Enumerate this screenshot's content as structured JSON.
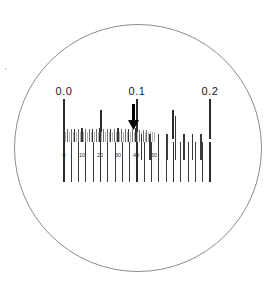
{
  "view": {
    "title": "Optical scale reticle view",
    "background_color": "#ffffff",
    "width": 277,
    "height": 284
  },
  "lens": {
    "name": "circular-field-of-view",
    "center_x": 138,
    "center_y": 148,
    "radius": 124,
    "stroke_color": "#8d8d8d"
  },
  "speck": {
    "x": 5,
    "y": 68,
    "color": "#cfcfcf"
  },
  "chart_data": {
    "type": "scale",
    "xlabel": "",
    "ylabel": "",
    "main_scale": {
      "labels": [
        "0.0",
        "0.1",
        "0.2"
      ],
      "label_values": [
        0.0,
        0.1,
        0.2
      ],
      "label_x": [
        64,
        137,
        210
      ],
      "unit_span_px": 73,
      "division_count": 20,
      "division_step": 0.01,
      "x_start": 64,
      "x_end": 210,
      "tick_color": "#3a3a3a"
    },
    "upper_ticks": [
      {
        "x": 64,
        "y": 99,
        "h": 40,
        "w": 1.6,
        "class": "major"
      },
      {
        "x": 101,
        "y": 110,
        "h": 29,
        "w": 1.4,
        "class": "major"
      },
      {
        "x": 137,
        "y": 99,
        "h": 40,
        "w": 1.6,
        "class": "major"
      },
      {
        "x": 173,
        "y": 110,
        "h": 29,
        "w": 1.4,
        "class": "major"
      },
      {
        "x": 210,
        "y": 99,
        "h": 40,
        "w": 1.6,
        "class": "major"
      }
    ],
    "mid_band": {
      "y": 128,
      "height": 14,
      "x_start": 64,
      "x_end": 155,
      "description": "dense vernier micro-division band"
    },
    "micro_ticks": [
      {
        "x": 64.0,
        "h": 14,
        "w": 1.3,
        "class": "micro-dark"
      },
      {
        "x": 65.8,
        "h": 10,
        "w": 0.8,
        "class": "micro-light"
      },
      {
        "x": 67.6,
        "h": 13,
        "w": 0.9,
        "class": "micro"
      },
      {
        "x": 69.4,
        "h": 10,
        "w": 0.8,
        "class": "micro-light"
      },
      {
        "x": 71.2,
        "h": 13,
        "w": 1.0,
        "class": "micro"
      },
      {
        "x": 73.0,
        "h": 10,
        "w": 0.8,
        "class": "micro-light"
      },
      {
        "x": 74.8,
        "h": 13,
        "w": 1.1,
        "class": "micro-dark"
      },
      {
        "x": 76.6,
        "h": 10,
        "w": 0.8,
        "class": "micro-light"
      },
      {
        "x": 78.4,
        "h": 13,
        "w": 0.9,
        "class": "micro"
      },
      {
        "x": 80.2,
        "h": 10,
        "w": 0.8,
        "class": "micro-light"
      },
      {
        "x": 82.0,
        "h": 14,
        "w": 1.3,
        "class": "micro-dark"
      },
      {
        "x": 83.8,
        "h": 10,
        "w": 0.8,
        "class": "micro-light"
      },
      {
        "x": 85.6,
        "h": 13,
        "w": 0.9,
        "class": "micro"
      },
      {
        "x": 87.4,
        "h": 10,
        "w": 0.8,
        "class": "micro-light"
      },
      {
        "x": 89.2,
        "h": 13,
        "w": 1.0,
        "class": "micro"
      },
      {
        "x": 91.0,
        "h": 10,
        "w": 0.8,
        "class": "micro-light"
      },
      {
        "x": 92.8,
        "h": 13,
        "w": 1.1,
        "class": "micro-dark"
      },
      {
        "x": 94.6,
        "h": 10,
        "w": 0.8,
        "class": "micro-light"
      },
      {
        "x": 96.4,
        "h": 13,
        "w": 0.9,
        "class": "micro"
      },
      {
        "x": 98.2,
        "h": 10,
        "w": 0.8,
        "class": "micro-light"
      },
      {
        "x": 100.0,
        "h": 14,
        "w": 1.3,
        "class": "micro-dark"
      },
      {
        "x": 101.8,
        "h": 10,
        "w": 0.8,
        "class": "micro-light"
      },
      {
        "x": 103.6,
        "h": 13,
        "w": 0.9,
        "class": "micro"
      },
      {
        "x": 105.4,
        "h": 10,
        "w": 0.8,
        "class": "micro-light"
      },
      {
        "x": 107.2,
        "h": 13,
        "w": 1.0,
        "class": "micro"
      },
      {
        "x": 109.0,
        "h": 10,
        "w": 0.8,
        "class": "micro-light"
      },
      {
        "x": 110.8,
        "h": 13,
        "w": 1.1,
        "class": "micro-dark"
      },
      {
        "x": 112.6,
        "h": 10,
        "w": 0.8,
        "class": "micro-light"
      },
      {
        "x": 114.4,
        "h": 13,
        "w": 0.9,
        "class": "micro"
      },
      {
        "x": 116.2,
        "h": 10,
        "w": 0.8,
        "class": "micro-light"
      },
      {
        "x": 118.0,
        "h": 14,
        "w": 1.3,
        "class": "micro-dark"
      },
      {
        "x": 119.8,
        "h": 10,
        "w": 0.8,
        "class": "micro-light"
      },
      {
        "x": 121.6,
        "h": 13,
        "w": 0.9,
        "class": "micro"
      },
      {
        "x": 123.4,
        "h": 10,
        "w": 0.8,
        "class": "micro-light"
      },
      {
        "x": 125.2,
        "h": 13,
        "w": 1.0,
        "class": "micro"
      },
      {
        "x": 127.0,
        "h": 10,
        "w": 0.8,
        "class": "micro-light"
      },
      {
        "x": 128.8,
        "h": 13,
        "w": 1.1,
        "class": "micro-dark"
      },
      {
        "x": 130.6,
        "h": 10,
        "w": 0.8,
        "class": "micro-light"
      },
      {
        "x": 132.4,
        "h": 13,
        "w": 0.9,
        "class": "micro"
      },
      {
        "x": 134.2,
        "h": 10,
        "w": 0.8,
        "class": "micro-light"
      },
      {
        "x": 136.0,
        "h": 14,
        "w": 1.3,
        "class": "micro-dark"
      },
      {
        "x": 137.8,
        "h": 10,
        "w": 0.8,
        "class": "micro-light"
      },
      {
        "x": 139.6,
        "h": 12,
        "w": 0.9,
        "class": "micro"
      },
      {
        "x": 141.4,
        "h": 10,
        "w": 0.8,
        "class": "micro-light"
      },
      {
        "x": 143.2,
        "h": 12,
        "w": 0.9,
        "class": "micro"
      },
      {
        "x": 145.0,
        "h": 10,
        "w": 0.8,
        "class": "micro-light"
      },
      {
        "x": 146.8,
        "h": 12,
        "w": 0.9,
        "class": "micro"
      },
      {
        "x": 148.6,
        "h": 10,
        "w": 0.8,
        "class": "micro-light"
      },
      {
        "x": 150.4,
        "h": 11,
        "w": 0.8,
        "class": "micro-light"
      },
      {
        "x": 152.2,
        "h": 10,
        "w": 0.8,
        "class": "micro-light"
      },
      {
        "x": 154.0,
        "h": 10,
        "w": 0.8,
        "class": "micro-light"
      }
    ],
    "micro_scale": {
      "labels": [
        "0",
        "10",
        "20",
        "30",
        "40",
        "50"
      ],
      "label_values": [
        0,
        10,
        20,
        30,
        40,
        50
      ],
      "label_x": [
        64,
        82,
        100,
        118,
        136,
        154
      ],
      "label_y": 152,
      "step": 10
    },
    "lower_ticks": [
      {
        "x": 64,
        "h": 40,
        "w": 1.6,
        "class": "major"
      },
      {
        "x": 71.3,
        "h": 40,
        "w": 1.2,
        "class": "tick"
      },
      {
        "x": 78.6,
        "h": 40,
        "w": 1.2,
        "class": "tick"
      },
      {
        "x": 85.9,
        "h": 40,
        "w": 1.2,
        "class": "tick"
      },
      {
        "x": 93.2,
        "h": 40,
        "w": 1.2,
        "class": "tick"
      },
      {
        "x": 100.5,
        "h": 40,
        "w": 1.4,
        "class": "major"
      },
      {
        "x": 107.8,
        "h": 40,
        "w": 1.2,
        "class": "tick"
      },
      {
        "x": 115.1,
        "h": 40,
        "w": 1.2,
        "class": "tick"
      },
      {
        "x": 122.4,
        "h": 40,
        "w": 1.2,
        "class": "tick"
      },
      {
        "x": 129.7,
        "h": 40,
        "w": 1.2,
        "class": "tick"
      },
      {
        "x": 137.0,
        "h": 40,
        "w": 1.6,
        "class": "major"
      },
      {
        "x": 144.3,
        "h": 40,
        "w": 1.2,
        "class": "tick"
      },
      {
        "x": 151.6,
        "h": 40,
        "w": 1.2,
        "class": "tick"
      },
      {
        "x": 158.9,
        "h": 40,
        "w": 1.2,
        "class": "tick"
      },
      {
        "x": 166.2,
        "h": 40,
        "w": 1.2,
        "class": "tick"
      },
      {
        "x": 173.5,
        "h": 40,
        "w": 1.4,
        "class": "major"
      },
      {
        "x": 180.8,
        "h": 40,
        "w": 1.2,
        "class": "tick"
      },
      {
        "x": 188.1,
        "h": 40,
        "w": 1.2,
        "class": "tick"
      },
      {
        "x": 195.4,
        "h": 40,
        "w": 1.2,
        "class": "tick"
      },
      {
        "x": 202.7,
        "h": 40,
        "w": 1.2,
        "class": "tick"
      },
      {
        "x": 210.0,
        "h": 40,
        "w": 1.6,
        "class": "major"
      }
    ],
    "lower_ticks_y": 142,
    "right_ticks": [
      {
        "x": 141.5,
        "y": 134,
        "h": 26,
        "w": 1.2,
        "class": "tick"
      },
      {
        "x": 150.0,
        "y": 134,
        "h": 26,
        "w": 1.2,
        "class": "tick"
      },
      {
        "x": 158.5,
        "y": 134,
        "h": 26,
        "w": 1.2,
        "class": "tick"
      },
      {
        "x": 167.0,
        "y": 134,
        "h": 26,
        "w": 1.2,
        "class": "tick"
      },
      {
        "x": 175.5,
        "y": 116,
        "h": 44,
        "w": 1.2,
        "class": "tick"
      },
      {
        "x": 184.0,
        "y": 134,
        "h": 26,
        "w": 1.2,
        "class": "tick"
      },
      {
        "x": 192.5,
        "y": 134,
        "h": 26,
        "w": 1.2,
        "class": "tick"
      },
      {
        "x": 201.0,
        "y": 134,
        "h": 26,
        "w": 1.2,
        "class": "tick"
      }
    ],
    "pointer": {
      "label": "measurement-pointer",
      "x": 133,
      "y_top": 104,
      "y_bottom": 130,
      "reading": "0.1",
      "color": "#000000"
    },
    "legend": [],
    "grid": false
  }
}
